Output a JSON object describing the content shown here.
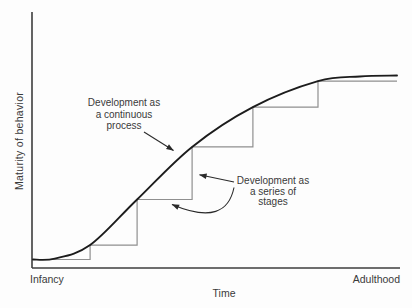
{
  "figure": {
    "axis_labels": {
      "y": "Maturity of behavior",
      "x": "Time"
    },
    "x_endpoints": {
      "left": "Infancy",
      "right": "Adulthood"
    },
    "annotations": {
      "continuous": {
        "text": "Development as\na continuous\nprocess",
        "target": "smooth curve"
      },
      "stages": {
        "text": "Development as\na series of\nstages",
        "target": "staircase steps"
      }
    },
    "colors": {
      "background": "#fdfdfd",
      "curve": "#1c1c1c",
      "stairs": "#8f8f8f",
      "axis": "#3d3d3d",
      "arrow": "#2a2a2a",
      "text": "#3a3a3a"
    }
  },
  "chart_data": {
    "type": "line",
    "title": "",
    "xlabel": "Time",
    "ylabel": "Maturity of behavior",
    "x_axis_qualitative": [
      "Infancy",
      "Adulthood"
    ],
    "y_axis_qualitative": "maturity of behavior (low to high)",
    "xlim": [
      0,
      100
    ],
    "ylim": [
      0,
      100
    ],
    "grid": false,
    "legend": "none (labels via arrowed annotations)",
    "series": [
      {
        "name": "Development as a continuous process",
        "style": "smooth sigmoid curve",
        "points": [
          [
            0,
            4.4
          ],
          [
            6,
            4.9
          ],
          [
            15.7,
            11.9
          ],
          [
            28.6,
            35.6
          ],
          [
            43.7,
            62.9
          ],
          [
            60.4,
            83.6
          ],
          [
            78.3,
            97.1
          ],
          [
            89.8,
            99.5
          ],
          [
            100,
            100
          ]
        ]
      },
      {
        "name": "Development as a series of stages",
        "style": "staircase inscribed under curve, corners touching curve",
        "corners": [
          [
            0,
            4.4
          ],
          [
            15.7,
            11.9
          ],
          [
            28.6,
            35.6
          ],
          [
            43.7,
            62.9
          ],
          [
            60.4,
            83.6
          ],
          [
            78.3,
            97.1
          ]
        ],
        "end_x": 100
      }
    ]
  }
}
